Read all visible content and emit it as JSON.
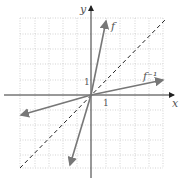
{
  "axes": {
    "x_label": "x",
    "y_label": "y",
    "x_tick": "1",
    "y_tick": "1"
  },
  "curves": [
    {
      "name": "f",
      "label": "f",
      "slope": 3
    },
    {
      "name": "f-inverse",
      "label": "f⁻¹",
      "slope": 0.333
    },
    {
      "name": "identity",
      "label": "y = x",
      "style": "dashed"
    }
  ],
  "colors": {
    "grid": "#c8c8c8",
    "axes": "#333333",
    "curve": "#777777",
    "dashed": "#222222"
  }
}
